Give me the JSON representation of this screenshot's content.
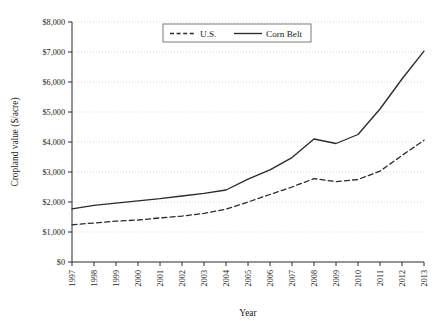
{
  "chart_data": {
    "type": "line",
    "title": "",
    "xlabel": "Year",
    "ylabel": "Cropland value ($/acre)",
    "x": [
      1997,
      1998,
      1999,
      2000,
      2001,
      2002,
      2003,
      2004,
      2005,
      2006,
      2007,
      2008,
      2009,
      2010,
      2011,
      2012,
      2013
    ],
    "xtick_labels": [
      "1997",
      "1998",
      "1999",
      "2000",
      "2001",
      "2002",
      "2003",
      "2004",
      "2005",
      "2006",
      "2007",
      "2008",
      "2009",
      "2010",
      "2011",
      "2012",
      "2013"
    ],
    "ytick_labels": [
      "$0",
      "$1,000",
      "$2,000",
      "$3,000",
      "$4,000",
      "$5,000",
      "$6,000",
      "$7,000",
      "$8,000"
    ],
    "ytick_values": [
      0,
      1000,
      2000,
      3000,
      4000,
      5000,
      6000,
      7000,
      8000
    ],
    "ylim": [
      0,
      8000
    ],
    "xlim": [
      1997,
      2013
    ],
    "grid": "horizontal-dotted",
    "legend_position": "top-center",
    "series": [
      {
        "name": "U.S.",
        "style": "dashed",
        "color": "#2b2b2b",
        "values": [
          1240,
          1300,
          1360,
          1400,
          1470,
          1530,
          1620,
          1760,
          2000,
          2250,
          2500,
          2780,
          2680,
          2750,
          3030,
          3550,
          4060
        ]
      },
      {
        "name": "Corn Belt",
        "style": "solid",
        "color": "#2b2b2b",
        "values": [
          1770,
          1890,
          1960,
          2040,
          2110,
          2200,
          2290,
          2400,
          2760,
          3070,
          3480,
          4100,
          3950,
          4250,
          5100,
          6100,
          7030
        ]
      }
    ]
  }
}
